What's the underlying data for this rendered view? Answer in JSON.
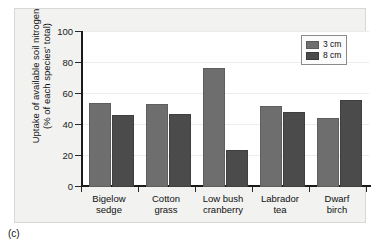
{
  "figure": {
    "caption": "(c)"
  },
  "legend": {
    "position": "top-right",
    "entries": [
      {
        "label": "3 cm",
        "color": "#6e6e6e"
      },
      {
        "label": "8 cm",
        "color": "#4b4b4b"
      }
    ]
  },
  "chart_data": {
    "type": "bar",
    "title": "",
    "xlabel": "",
    "ylabel": "Uptake of available soil nitrogen (% of each species' total)",
    "ylabel_line1": "Uptake of available soil nitrogen",
    "ylabel_line2": "(% of each species' total)",
    "ylim": [
      0,
      100
    ],
    "yticks": [
      0,
      20,
      40,
      60,
      80,
      100
    ],
    "ytick_labels": [
      "0",
      "20",
      "40",
      "60",
      "80",
      "100"
    ],
    "grid": true,
    "legend_position": "upper right",
    "categories": [
      "Bigelow sedge",
      "Cotton grass",
      "Low bush cranberry",
      "Labrador tea",
      "Dwarf birch"
    ],
    "category_lines": [
      [
        "Bigelow",
        "sedge"
      ],
      [
        "Cotton",
        "grass"
      ],
      [
        "Low bush",
        "cranberry"
      ],
      [
        "Labrador",
        "tea"
      ],
      [
        "Dwarf",
        "birch"
      ]
    ],
    "series": [
      {
        "name": "3 cm",
        "color": "#6e6e6e",
        "values": [
          54,
          53,
          76,
          52,
          44
        ]
      },
      {
        "name": "8 cm",
        "color": "#4b4b4b",
        "values": [
          46,
          47,
          24,
          48,
          56
        ]
      }
    ]
  }
}
